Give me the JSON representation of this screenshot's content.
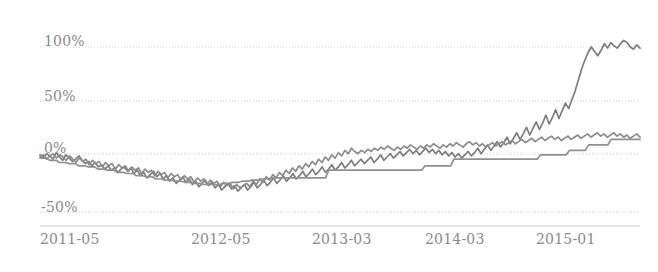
{
  "chart_data": {
    "type": "line",
    "title": "",
    "subtitle": "",
    "xlabel": "",
    "ylabel": "",
    "grid": true,
    "legend": false,
    "legend_position": "none",
    "line_color": "#808080",
    "grid_color": "#cfcfcf",
    "axis_color": "#c8c8c8",
    "background": "#ffffff",
    "ylim": [
      -62,
      118
    ],
    "yticks": [
      -50,
      0,
      50,
      100
    ],
    "ytick_labels": [
      "-50%",
      "0%",
      "50%",
      "100%"
    ],
    "xtick_labels": [
      "2011-05",
      "2012-05",
      "2013-03",
      "2014-03",
      "2015-01"
    ],
    "xtick_positions": [
      0,
      12,
      22,
      34,
      44
    ],
    "xlim": [
      0,
      50
    ],
    "series": [
      {
        "name": "series-1",
        "color": "#7d7d7d",
        "values": [
          2,
          -1,
          3,
          1,
          -2,
          4,
          0,
          -3,
          2,
          -1,
          -4,
          -2,
          1,
          -3,
          -6,
          -4,
          -8,
          -5,
          -9,
          -7,
          -11,
          -8,
          -12,
          -10,
          -14,
          -11,
          -9,
          -13,
          -10,
          -15,
          -12,
          -17,
          -14,
          -19,
          -16,
          -13,
          -18,
          -15,
          -20,
          -17,
          -22,
          -19,
          -24,
          -21,
          -18,
          -23,
          -20,
          -25,
          -22,
          -27,
          -24,
          -21,
          -26,
          -23,
          -28,
          -25,
          -30,
          -27,
          -24,
          -29,
          -26,
          -31,
          -28,
          -25,
          -30,
          -27,
          -23,
          -28,
          -25,
          -21,
          -26,
          -23,
          -19,
          -24,
          -21,
          -17,
          -22,
          -19,
          -15,
          -20,
          -17,
          -13,
          -18,
          -15,
          -11,
          -16,
          -13,
          -9,
          -14,
          -11,
          -7,
          -12,
          -9,
          -5,
          -10,
          -7,
          -3,
          -8,
          -5,
          -2,
          -6,
          -3,
          0,
          -5,
          -2,
          2,
          -3,
          0,
          3,
          -1,
          2,
          5,
          1,
          4,
          7,
          3,
          6,
          2,
          5,
          8,
          4,
          7,
          3,
          6,
          2,
          5,
          1,
          4,
          0,
          3,
          -1,
          2,
          5,
          1,
          4,
          8,
          3,
          7,
          11,
          6,
          10,
          14,
          9,
          13,
          18,
          12,
          17,
          22,
          16,
          21,
          27,
          20,
          26,
          32,
          25,
          31,
          38,
          30,
          36,
          43,
          35,
          42,
          49,
          44,
          52,
          60,
          70,
          80,
          88,
          95,
          100,
          96,
          92,
          97,
          103,
          99,
          104,
          101,
          99,
          103,
          106,
          104,
          100,
          98,
          102,
          99
        ]
      },
      {
        "name": "series-2",
        "color": "#8c8c8c",
        "values": [
          0,
          2,
          -2,
          1,
          3,
          -1,
          2,
          0,
          -3,
          1,
          -2,
          -5,
          -1,
          -4,
          -2,
          -7,
          -3,
          -6,
          -4,
          -9,
          -5,
          -8,
          -6,
          -11,
          -7,
          -10,
          -8,
          -13,
          -9,
          -12,
          -10,
          -15,
          -11,
          -14,
          -12,
          -17,
          -13,
          -16,
          -14,
          -19,
          -15,
          -18,
          -16,
          -21,
          -17,
          -20,
          -18,
          -23,
          -19,
          -22,
          -20,
          -25,
          -21,
          -24,
          -22,
          -27,
          -23,
          -26,
          -24,
          -29,
          -25,
          -28,
          -26,
          -24,
          -27,
          -22,
          -25,
          -20,
          -23,
          -18,
          -21,
          -16,
          -19,
          -14,
          -17,
          -12,
          -15,
          -10,
          -13,
          -8,
          -11,
          -6,
          -9,
          -4,
          -7,
          -2,
          -5,
          0,
          -3,
          2,
          -1,
          4,
          1,
          6,
          3,
          8,
          5,
          3,
          6,
          4,
          7,
          5,
          8,
          6,
          9,
          7,
          10,
          8,
          6,
          9,
          7,
          10,
          8,
          11,
          9,
          7,
          10,
          8,
          11,
          9,
          12,
          10,
          8,
          11,
          9,
          12,
          10,
          13,
          11,
          9,
          12,
          14,
          11,
          13,
          10,
          12,
          9,
          11,
          13,
          10,
          12,
          14,
          11,
          13,
          15,
          12,
          14,
          16,
          13,
          15,
          17,
          14,
          16,
          18,
          15,
          17,
          19,
          16,
          18,
          15,
          17,
          19,
          16,
          18,
          20,
          17,
          19,
          21,
          18,
          20,
          22,
          19,
          21,
          18,
          20,
          22,
          19,
          21,
          18,
          20,
          17,
          19,
          21,
          18
        ]
      },
      {
        "name": "series-3-stepped",
        "color": "#909090",
        "values": [
          -1,
          -1,
          -1,
          -3,
          -3,
          -3,
          -5,
          -5,
          -5,
          -6,
          -6,
          -6,
          -8,
          -8,
          -8,
          -9,
          -9,
          -9,
          -11,
          -11,
          -11,
          -12,
          -12,
          -12,
          -14,
          -14,
          -14,
          -15,
          -15,
          -15,
          -17,
          -17,
          -17,
          -18,
          -18,
          -18,
          -20,
          -20,
          -20,
          -21,
          -21,
          -21,
          -22,
          -22,
          -22,
          -23,
          -23,
          -23,
          -24,
          -24,
          -24,
          -25,
          -25,
          -25,
          -25,
          -25,
          -25,
          -24,
          -24,
          -24,
          -23,
          -23,
          -23,
          -22,
          -22,
          -22,
          -21,
          -21,
          -21,
          -20,
          -20,
          -20,
          -19,
          -19,
          -19,
          -19,
          -19,
          -19,
          -19,
          -19,
          -19,
          -19,
          -19,
          -19,
          -19,
          -19,
          -19,
          -19,
          -19,
          -19,
          -12,
          -12,
          -12,
          -12,
          -12,
          -12,
          -12,
          -12,
          -12,
          -12,
          -12,
          -12,
          -12,
          -12,
          -12,
          -12,
          -12,
          -12,
          -12,
          -12,
          -12,
          -12,
          -12,
          -12,
          -12,
          -12,
          -12,
          -12,
          -12,
          -12,
          -8,
          -8,
          -8,
          -8,
          -8,
          -8,
          -8,
          -8,
          -8,
          -2,
          -2,
          -2,
          -2,
          -2,
          -2,
          -2,
          -2,
          -2,
          -2,
          -2,
          -2,
          -2,
          -2,
          -2,
          -2,
          -2,
          -2,
          -2,
          -2,
          -2,
          -2,
          -2,
          -2,
          -2,
          -2,
          -2,
          2,
          2,
          2,
          2,
          2,
          2,
          2,
          2,
          2,
          6,
          6,
          6,
          6,
          6,
          6,
          11,
          11,
          11,
          11,
          11,
          11,
          11,
          16,
          16,
          16,
          16,
          16,
          16,
          16,
          16,
          16,
          16
        ]
      }
    ]
  },
  "axes": {
    "y_labels": [
      {
        "text": "100%",
        "top": 33,
        "left": 44
      },
      {
        "text": "50%",
        "top": 88,
        "left": 44
      },
      {
        "text": "0%",
        "top": 140,
        "left": 44
      },
      {
        "text": "-50%",
        "top": 199,
        "left": 41
      }
    ],
    "x_labels": [
      {
        "text": "2011-05",
        "left": 40
      },
      {
        "text": "2012-05",
        "left": 191
      },
      {
        "text": "2013-03",
        "left": 312
      },
      {
        "text": "2014-03",
        "left": 425
      },
      {
        "text": "2015-01",
        "left": 536
      }
    ],
    "x_label_top": 231
  }
}
